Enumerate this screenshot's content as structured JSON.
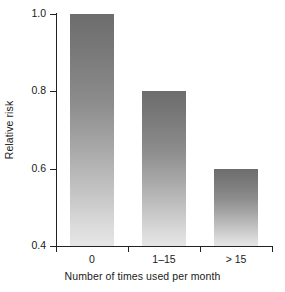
{
  "chart_data": {
    "type": "bar",
    "title": "",
    "subtitle": "",
    "xlabel": "Number of times used per month",
    "ylabel": "Relative risk",
    "categories": [
      "0",
      "1–15",
      "> 15"
    ],
    "values": [
      1.0,
      0.8,
      0.6
    ],
    "series": [
      {
        "name": "Relative risk",
        "values": [
          1.0,
          0.8,
          0.6
        ]
      }
    ],
    "ylim": [
      0.4,
      1.0
    ],
    "yticks": [
      "0.4",
      "0.6",
      "0.8",
      "1.0"
    ],
    "ytick_values": [
      0.4,
      0.6,
      0.8,
      1.0
    ],
    "grid": false,
    "legend": "none",
    "bar_fill_top_color": "#6d6d6d",
    "bar_fill_bottom_color": "#e6e6e6",
    "axis_color": "#222222",
    "background_color": "#ffffff"
  }
}
